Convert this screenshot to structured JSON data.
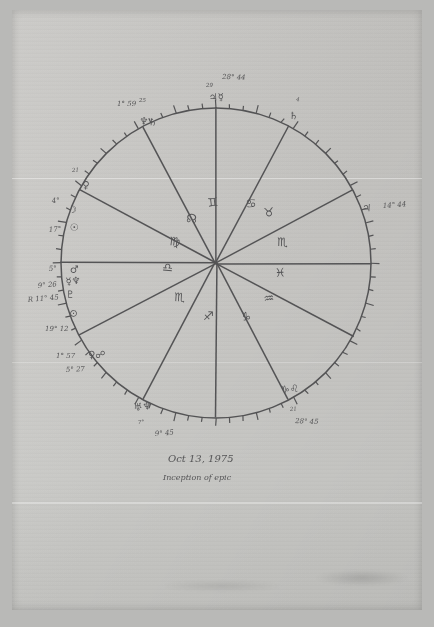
{
  "document": {
    "type": "hand-drawn astrological natal chart",
    "medium": "pencil on paper, photographed",
    "caption_date": "Oct 13, 1975",
    "caption_note": "Inception of epic"
  },
  "colors": {
    "paper": "#cbcac7",
    "backdrop": "#b9b9b7",
    "ink": "#4a4a4c"
  },
  "chart_data": {
    "type": "wheel",
    "center": {
      "x": 216,
      "y": 263
    },
    "radius": 155,
    "ticks": {
      "count": 72,
      "note": "degree ticks around rim, longer every 5th"
    },
    "sign_labels": [
      {
        "glyph": "♋",
        "name": "Gemini",
        "x": 246,
        "y": 208
      },
      {
        "glyph": "♊",
        "name": "Cancer",
        "x": 208,
        "y": 207
      },
      {
        "glyph": "☊",
        "name": "North Node",
        "x": 186,
        "y": 222
      },
      {
        "glyph": "♍",
        "name": "Virgo",
        "x": 169,
        "y": 245
      },
      {
        "glyph": "♎",
        "name": "Libra",
        "x": 162,
        "y": 271
      },
      {
        "glyph": "♏",
        "name": "Scorpio",
        "x": 174,
        "y": 301
      },
      {
        "glyph": "♐",
        "name": "Sagittarius",
        "x": 203,
        "y": 320
      },
      {
        "glyph": "♑",
        "name": "Capricorn",
        "x": 240,
        "y": 320
      },
      {
        "glyph": "♒",
        "name": "Aquarius",
        "x": 264,
        "y": 303
      },
      {
        "glyph": "♓",
        "name": "Pisces",
        "x": 275,
        "y": 277
      },
      {
        "glyph": "♏",
        "name": "Scorpio-b",
        "x": 277,
        "y": 246
      },
      {
        "glyph": "♉",
        "name": "Taurus",
        "x": 264,
        "y": 217
      }
    ],
    "rim_markings": [
      {
        "id": "top",
        "degree_text": "28° 44",
        "small_text": "29",
        "glyphs": "♃☿",
        "tx": 222,
        "ty": 79,
        "sx": 206,
        "sy": 87,
        "gx": 209,
        "gy": 101
      },
      {
        "id": "upper-right",
        "degree_text": "",
        "small_text": "4",
        "glyphs": "♄",
        "tx": 0,
        "ty": 0,
        "sx": 296,
        "sy": 101,
        "gx": 289,
        "gy": 119
      },
      {
        "id": "right",
        "degree_text": "14° 44",
        "small_text": "",
        "glyphs": "♃",
        "tx": 383,
        "ty": 208,
        "sx": 0,
        "sy": 0,
        "gx": 362,
        "gy": 211
      },
      {
        "id": "lower-right",
        "degree_text": "28° 45",
        "small_text": "21",
        "glyphs": "♑♌",
        "tx": 295,
        "ty": 423,
        "sx": 290,
        "sy": 411,
        "gx": 281,
        "gy": 393
      },
      {
        "id": "bottom",
        "degree_text": "9° 45",
        "small_text": "7°",
        "glyphs": "♅♆",
        "tx": 155,
        "ty": 436,
        "sx": 138,
        "sy": 424,
        "gx": 134,
        "gy": 411
      },
      {
        "id": "lower-left-b",
        "degree_text": "5° 27",
        "small_text": "",
        "glyphs": "",
        "tx": 66,
        "ty": 372,
        "sx": 0,
        "sy": 0,
        "gx": 0,
        "gy": 0
      },
      {
        "id": "lower-left-a",
        "degree_text": "1° 57",
        "small_text": "",
        "glyphs": "♀☍",
        "tx": 56,
        "ty": 358,
        "sx": 0,
        "sy": 0,
        "gx": 88,
        "gy": 358
      },
      {
        "id": "left-low",
        "degree_text": "19° 12",
        "small_text": "",
        "glyphs": "⊙",
        "tx": 45,
        "ty": 331,
        "sx": 0,
        "sy": 0,
        "gx": 69,
        "gy": 316
      },
      {
        "id": "left-plu",
        "degree_text": "R 11° 45",
        "small_text": "",
        "glyphs": "♇",
        "tx": 28,
        "ty": 302,
        "sx": 0,
        "sy": 0,
        "gx": 66,
        "gy": 298
      },
      {
        "id": "left-merc",
        "degree_text": "9° 26",
        "small_text": "",
        "glyphs": "☿♆",
        "tx": 38,
        "ty": 288,
        "sx": 0,
        "sy": 0,
        "gx": 66,
        "gy": 285
      },
      {
        "id": "left-mars",
        "degree_text": "5°",
        "small_text": "",
        "glyphs": "♂",
        "tx": 49,
        "ty": 271,
        "sx": 0,
        "sy": 0,
        "gx": 70,
        "gy": 273
      },
      {
        "id": "left-sun",
        "degree_text": "17°",
        "small_text": "",
        "glyphs": "☉",
        "tx": 49,
        "ty": 232,
        "sx": 0,
        "sy": 0,
        "gx": 70,
        "gy": 231
      },
      {
        "id": "left-moon",
        "degree_text": "4°",
        "small_text": "",
        "glyphs": "☽",
        "tx": 52,
        "ty": 203,
        "sx": 0,
        "sy": 0,
        "gx": 68,
        "gy": 213
      },
      {
        "id": "left-asc",
        "degree_text": "",
        "small_text": "21",
        "glyphs": "♀",
        "tx": 0,
        "ty": 0,
        "sx": 72,
        "sy": 172,
        "gx": 82,
        "gy": 188
      },
      {
        "id": "upper-left",
        "degree_text": "1° 59",
        "small_text": "25",
        "glyphs": "♆♄",
        "tx": 117,
        "ty": 106,
        "sx": 139,
        "sy": 102,
        "gx": 139,
        "gy": 124
      }
    ],
    "cusp_lines": [
      {
        "id": "cusp-1",
        "angle_deg": 180,
        "label": "ascendant-horizontal-left"
      },
      {
        "id": "cusp-7",
        "angle_deg": 0,
        "label": "descendant-horizontal-right"
      },
      {
        "id": "cusp-10",
        "angle_deg": 90,
        "label": "midheaven-vertical-top"
      },
      {
        "id": "cusp-4",
        "angle_deg": 270,
        "label": "imum-coeli-vertical-bottom"
      },
      {
        "id": "cusp-11",
        "angle_deg": 118,
        "label": "upper-left-a"
      },
      {
        "id": "cusp-12",
        "angle_deg": 152,
        "label": "upper-left-b"
      },
      {
        "id": "cusp-9",
        "angle_deg": 62,
        "label": "upper-right-a"
      },
      {
        "id": "cusp-8",
        "angle_deg": 28,
        "label": "upper-right-b"
      },
      {
        "id": "cusp-2",
        "angle_deg": 208,
        "label": "lower-left-a"
      },
      {
        "id": "cusp-3",
        "angle_deg": 242,
        "label": "lower-left-b"
      },
      {
        "id": "cusp-6",
        "angle_deg": 298,
        "label": "lower-right-a"
      },
      {
        "id": "cusp-5",
        "angle_deg": 332,
        "label": "lower-right-b"
      }
    ]
  }
}
